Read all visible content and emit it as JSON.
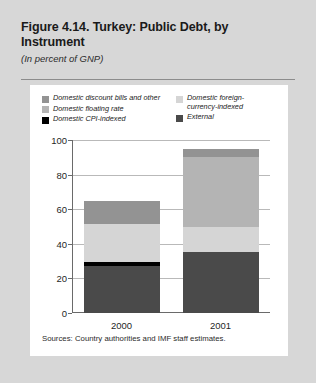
{
  "figure": {
    "title": "Figure 4.14. Turkey: Public Debt,\nby Instrument",
    "subtitle": "(In percent of GNP)",
    "source_note": "Sources: Country authorities and IMF staff estimates."
  },
  "colors": {
    "background": "#d7d7d7",
    "card": "#ffffff",
    "domestic_discount_bills": "#939393",
    "domestic_floating_rate": "#b4b4b4",
    "domestic_cpi_indexed": "#000000",
    "domestic_fx_indexed": "#d5d5d5",
    "external": "#4a4a4a",
    "gridline": "#b9b9b9",
    "axis": "#6a6a6a"
  },
  "chart_data": {
    "type": "bar",
    "stacked": true,
    "title": "Figure 4.14. Turkey: Public Debt, by Instrument",
    "subtitle": "(In percent of GNP)",
    "xlabel": "",
    "ylabel": "",
    "ylim": [
      0,
      100
    ],
    "yticks": [
      0,
      20,
      40,
      60,
      80,
      100
    ],
    "ytick_labels": [
      "0",
      "20",
      "40",
      "60",
      "80",
      "100"
    ],
    "grid": true,
    "legend_position": "top",
    "categories": [
      "2000",
      "2001"
    ],
    "series": [
      {
        "name": "External",
        "color": "#4a4a4a",
        "values": [
          27,
          35
        ]
      },
      {
        "name": "Domestic CPI-indexed",
        "color": "#000000",
        "values": [
          2.5,
          0
        ]
      },
      {
        "name": "Domestic foreign-currency-indexed",
        "color": "#d5d5d5",
        "values": [
          22,
          15
        ]
      },
      {
        "name": "Domestic floating rate",
        "color": "#b4b4b4",
        "values": [
          0,
          40
        ]
      },
      {
        "name": "Domestic discount bills and other",
        "color": "#939393",
        "values": [
          13.5,
          5
        ]
      }
    ],
    "totals": [
      65,
      95
    ],
    "source": "Sources: Country authorities and IMF staff estimates."
  },
  "legend": {
    "left_column": [
      {
        "label": "Domestic discount bills and other",
        "color": "#939393"
      },
      {
        "label": "Domestic floating rate",
        "color": "#b4b4b4"
      },
      {
        "label": "Domestic CPI-indexed",
        "color": "#000000"
      }
    ],
    "right_column": [
      {
        "label": "Domestic foreign-\ncurrency-indexed",
        "color": "#d5d5d5"
      },
      {
        "label": "External",
        "color": "#4a4a4a"
      }
    ]
  }
}
